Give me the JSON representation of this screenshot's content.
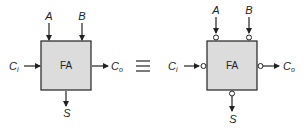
{
  "diagram": {
    "left_block": {
      "label": "FA",
      "inputs": {
        "a": "A",
        "b": "B",
        "ci": "C",
        "ci_sub": "i"
      },
      "outputs": {
        "co": "C",
        "co_sub": "o",
        "s": "S"
      },
      "inverted": false
    },
    "equivalence_symbol": "≡",
    "right_block": {
      "label": "FA",
      "inputs": {
        "a": "A",
        "b": "B",
        "ci": "C",
        "ci_sub": "i"
      },
      "outputs": {
        "co": "C",
        "co_sub": "o",
        "s": "S"
      },
      "inverted": true
    },
    "colors": {
      "box_fill": "#dcdcdc",
      "stroke": "#222222"
    }
  }
}
